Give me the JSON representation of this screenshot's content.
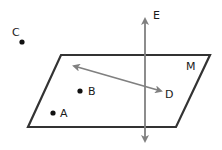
{
  "diagram": {
    "type": "geometry-plane",
    "plane": {
      "label": "M",
      "vertices": [
        [
          61,
          55
        ],
        [
          210,
          55
        ],
        [
          176,
          127
        ],
        [
          28,
          127
        ]
      ],
      "stroke": "#333333"
    },
    "line_e": {
      "label": "E",
      "from": [
        145,
        143
      ],
      "to": [
        145,
        17
      ],
      "stroke": "#808080",
      "arrows": "both"
    },
    "line_in_plane": {
      "end_label": "D",
      "from": [
        72,
        65
      ],
      "to": [
        163,
        92
      ],
      "stroke": "#808080",
      "arrows": "both"
    },
    "points": [
      {
        "label": "C",
        "x": 22,
        "y": 42
      },
      {
        "label": "B",
        "x": 80,
        "y": 91
      },
      {
        "label": "A",
        "x": 53,
        "y": 113
      }
    ],
    "labels": {
      "C": "C",
      "B": "B",
      "A": "A",
      "D": "D",
      "E": "E",
      "M": "M"
    }
  }
}
